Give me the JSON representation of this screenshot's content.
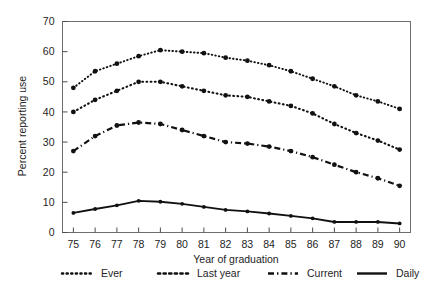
{
  "chart_data": {
    "type": "line",
    "title": "",
    "xlabel": "Year of graduation",
    "ylabel": "Percent reporting use",
    "xlim": [
      74.5,
      90.5
    ],
    "ylim": [
      0,
      70
    ],
    "yticks": [
      0,
      10,
      20,
      30,
      40,
      50,
      60,
      70
    ],
    "grid": false,
    "legend_position": "below",
    "x": [
      75,
      76,
      77,
      78,
      79,
      80,
      81,
      82,
      83,
      84,
      85,
      86,
      87,
      88,
      89,
      90
    ],
    "categories": [
      "75",
      "76",
      "77",
      "78",
      "79",
      "80",
      "81",
      "82",
      "83",
      "84",
      "85",
      "86",
      "87",
      "88",
      "89",
      "90"
    ],
    "series": [
      {
        "name": "Ever",
        "style": "fine-dotted",
        "color": "#111111",
        "values": [
          48,
          53.5,
          56,
          58.5,
          60.5,
          60,
          59.5,
          58,
          57,
          55.5,
          53.5,
          51,
          48.5,
          45.5,
          43.5,
          41
        ]
      },
      {
        "name": "Last year",
        "style": "coarse-dotted",
        "color": "#111111",
        "values": [
          40,
          44,
          47,
          50,
          50,
          48.5,
          47,
          45.5,
          45,
          43.5,
          42,
          39.5,
          36,
          33,
          30.5,
          27.5
        ]
      },
      {
        "name": "Current",
        "style": "dash-dot",
        "color": "#111111",
        "values": [
          27,
          32,
          35.5,
          36.5,
          36,
          34,
          32,
          30,
          29.5,
          28.5,
          27,
          25,
          22.5,
          20,
          18,
          15.5
        ]
      },
      {
        "name": "Daily",
        "style": "solid",
        "color": "#111111",
        "values": [
          6.5,
          7.8,
          9,
          10.5,
          10.2,
          9.5,
          8.5,
          7.5,
          7,
          6.3,
          5.5,
          4.7,
          3.5,
          3.5,
          3.5,
          3
        ]
      }
    ]
  },
  "axes": {
    "y_title": "Percent reporting use",
    "x_title": "Year of graduation",
    "y_tick_labels": [
      "0",
      "10",
      "20",
      "30",
      "40",
      "50",
      "60",
      "70"
    ],
    "x_tick_labels": [
      "75",
      "76",
      "77",
      "78",
      "79",
      "80",
      "81",
      "82",
      "83",
      "84",
      "85",
      "86",
      "87",
      "88",
      "89",
      "90"
    ]
  },
  "legend": {
    "entries": [
      {
        "label": "Ever",
        "style": "fine-dotted"
      },
      {
        "label": "Last year",
        "style": "coarse-dotted"
      },
      {
        "label": "Current",
        "style": "dash-dot"
      },
      {
        "label": "Daily",
        "style": "solid"
      }
    ]
  },
  "colors": {
    "ink": "#111111",
    "frame": "#6e6e6e",
    "background": "#ffffff",
    "marker_artifact": "#3c7d32"
  }
}
